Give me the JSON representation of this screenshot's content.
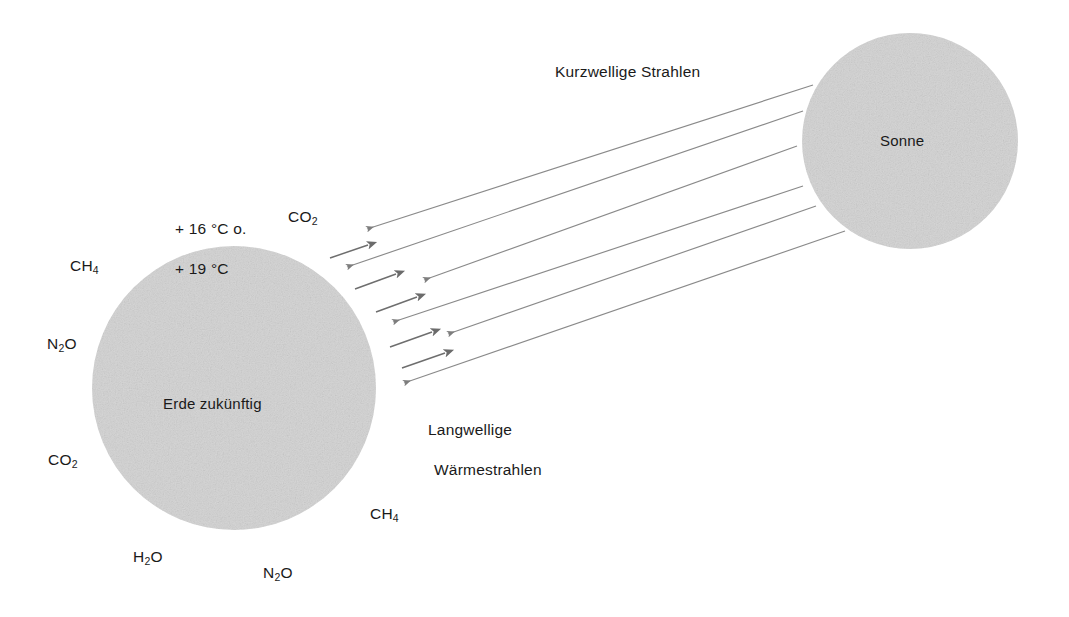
{
  "diagram": {
    "title_semantic": "Treibhauseffekt - Erde zukuenftig",
    "colors": {
      "body_fill": "#d6d6d6",
      "ray_stroke": "#8a8a8a",
      "short_ray_stroke": "#6e6e6e",
      "text": "#1a1a1a",
      "background": "#ffffff"
    },
    "bodies": {
      "earth": {
        "label": "Erde zukünftig",
        "cx": 234,
        "cy": 388,
        "r": 142
      },
      "sun": {
        "label": "Sonne",
        "cx": 910,
        "cy": 141,
        "r": 108
      }
    },
    "ray_labels": {
      "incoming": "Kurzwellige Strahlen",
      "outgoing_line1": "Langwellige",
      "outgoing_line2": "Wärmestrahlen"
    },
    "temperature": {
      "line1": "+ 16 °C o.",
      "line2": "+ 19 °C"
    },
    "gas_labels": [
      {
        "id": "co2-top",
        "text_main": "CO",
        "text_sub": "2",
        "x": 288,
        "y": 207
      },
      {
        "id": "ch4-upper-left",
        "text_main": "CH",
        "text_sub": "4",
        "x": 70,
        "y": 256
      },
      {
        "id": "n2o-left",
        "text_main": "N",
        "text_sub": "2",
        "text_tail": "O",
        "x": 47,
        "y": 334
      },
      {
        "id": "co2-lower-left",
        "text_main": "CO",
        "text_sub": "2",
        "x": 48,
        "y": 450
      },
      {
        "id": "h2o-bottom",
        "text_main": "H",
        "text_sub": "2",
        "text_tail": "O",
        "x": 133,
        "y": 547
      },
      {
        "id": "n2o-bottom",
        "text_main": "N",
        "text_sub": "2",
        "text_tail": "O",
        "x": 263,
        "y": 563
      },
      {
        "id": "ch4-lower-right",
        "text_main": "CH",
        "text_sub": "4",
        "x": 370,
        "y": 504
      }
    ],
    "long_rays": [
      {
        "x1": 813,
        "y1": 85,
        "x2": 367,
        "y2": 229
      },
      {
        "x1": 803,
        "y1": 111,
        "x2": 347,
        "y2": 267
      },
      {
        "x1": 797,
        "y1": 146,
        "x2": 424,
        "y2": 280
      },
      {
        "x1": 803,
        "y1": 186,
        "x2": 393,
        "y2": 322
      },
      {
        "x1": 816,
        "y1": 206,
        "x2": 448,
        "y2": 334
      },
      {
        "x1": 845,
        "y1": 231,
        "x2": 404,
        "y2": 383
      }
    ],
    "short_rays": [
      {
        "x1": 330,
        "y1": 258,
        "x2": 368,
        "y2": 245
      },
      {
        "x1": 355,
        "y1": 289,
        "x2": 396,
        "y2": 274
      },
      {
        "x1": 376,
        "y1": 312,
        "x2": 417,
        "y2": 297
      },
      {
        "x1": 390,
        "y1": 347,
        "x2": 432,
        "y2": 332
      },
      {
        "x1": 402,
        "y1": 368,
        "x2": 445,
        "y2": 353
      }
    ],
    "counts": {
      "incoming_rays": 6,
      "outgoing_rays": 5,
      "gas_labels": 7
    }
  }
}
